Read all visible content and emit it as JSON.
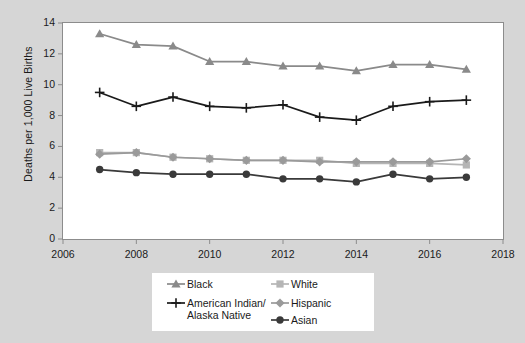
{
  "chart_data": {
    "type": "line",
    "title": "",
    "subtitle": "",
    "xlabel": "",
    "ylabel": "Deaths per 1,000 Live Births",
    "xlim": [
      2006,
      2018
    ],
    "ylim": [
      0,
      14
    ],
    "xticks": [
      2006,
      2008,
      2010,
      2012,
      2014,
      2016,
      2018
    ],
    "xtick_labels": [
      "2006",
      "2008",
      "2010",
      "2012",
      "2014",
      "2016",
      "2018"
    ],
    "yticks": [
      0,
      2,
      4,
      6,
      8,
      10,
      12,
      14
    ],
    "ytick_labels": [
      "0",
      "2",
      "4",
      "6",
      "8",
      "10",
      "12",
      "14"
    ],
    "grid": false,
    "legend_position": "below-center",
    "x": [
      2007,
      2008,
      2009,
      2010,
      2011,
      2012,
      2013,
      2014,
      2015,
      2016,
      2017
    ],
    "series": [
      {
        "name": "Black",
        "marker": "triangle",
        "color": "#8a8a8a",
        "values": [
          13.3,
          12.6,
          12.5,
          11.5,
          11.5,
          11.2,
          11.2,
          10.9,
          11.3,
          11.3,
          11.0
        ]
      },
      {
        "name": "American Indian/\nAlaska Native",
        "marker": "plus",
        "color": "#1a1a1a",
        "values": [
          9.5,
          8.6,
          9.2,
          8.6,
          8.5,
          8.7,
          7.9,
          7.7,
          8.6,
          8.9,
          9.0
        ]
      },
      {
        "name": "White",
        "marker": "square",
        "color": "#b5b5b5",
        "values": [
          5.6,
          5.6,
          5.3,
          5.2,
          5.1,
          5.1,
          5.1,
          4.9,
          4.9,
          4.9,
          4.8
        ]
      },
      {
        "name": "Hispanic",
        "marker": "diamond",
        "color": "#9a9a9a",
        "values": [
          5.5,
          5.6,
          5.3,
          5.2,
          5.1,
          5.1,
          5.0,
          5.0,
          5.0,
          5.0,
          5.2
        ]
      },
      {
        "name": "Asian",
        "marker": "circle",
        "color": "#3a3a3a",
        "values": [
          4.5,
          4.3,
          4.2,
          4.2,
          4.2,
          3.9,
          3.9,
          3.7,
          4.2,
          3.9,
          4.0
        ]
      }
    ]
  },
  "axes": {
    "y_title": "Deaths per 1,000 Live Births"
  },
  "legend": {
    "items": [
      {
        "label": "Black",
        "marker": "triangle",
        "color": "#8a8a8a"
      },
      {
        "label": "American Indian/\nAlaska Native",
        "marker": "plus",
        "color": "#1a1a1a"
      },
      {
        "label": "White",
        "marker": "square",
        "color": "#b5b5b5"
      },
      {
        "label": "Hispanic",
        "marker": "diamond",
        "color": "#9a9a9a"
      },
      {
        "label": "Asian",
        "marker": "circle",
        "color": "#3a3a3a"
      }
    ]
  },
  "colors": {
    "background": "#d6d6d6",
    "plot_background": "#ffffff",
    "axis": "#8c8c8c",
    "text": "#1a1a1a"
  }
}
